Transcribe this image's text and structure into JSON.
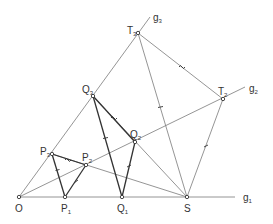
{
  "diagram": {
    "type": "geometric-construction",
    "colors": {
      "line": "#7a7a7a",
      "segment": "#333333",
      "point_fill": "#ffffff",
      "text": "#333333"
    },
    "points": {
      "O": {
        "x": 19,
        "y": 197,
        "label": "O",
        "sub": ""
      },
      "P1": {
        "x": 65,
        "y": 197,
        "label": "P",
        "sub": "1"
      },
      "Q1": {
        "x": 122,
        "y": 197,
        "label": "Q",
        "sub": "1"
      },
      "S": {
        "x": 187,
        "y": 197,
        "label": "S",
        "sub": ""
      },
      "P3": {
        "x": 52,
        "y": 154,
        "label": "P",
        "sub": "3"
      },
      "P2": {
        "x": 86,
        "y": 165,
        "label": "P",
        "sub": "2"
      },
      "Q3": {
        "x": 93,
        "y": 96,
        "label": "Q",
        "sub": "3"
      },
      "Q2": {
        "x": 135,
        "y": 142,
        "label": "Q",
        "sub": "2"
      },
      "T3": {
        "x": 138,
        "y": 33,
        "label": "T",
        "sub": "3"
      },
      "T2": {
        "x": 223,
        "y": 99,
        "label": "T",
        "sub": "2"
      }
    },
    "lines": [
      {
        "name": "g1",
        "label": "g",
        "sub": "1"
      },
      {
        "name": "g2",
        "label": "g",
        "sub": "2"
      },
      {
        "name": "g3",
        "label": "g",
        "sub": "3"
      }
    ],
    "segments_thin": [
      "O-g1end",
      "O-g2end",
      "O-g3end",
      "P3-S",
      "Q3-S",
      "T3-S",
      "T3-T2",
      "T2-S"
    ],
    "segments_thick": [
      "P3-P1",
      "P1-P2",
      "P3-P2",
      "Q3-Q1",
      "Q1-Q2",
      "Q3-Q2"
    ],
    "tick_marks": {
      "single_bar": [
        "P3-P1",
        "Q3-Q1",
        "T3-S"
      ],
      "single_slash": [
        "P1-P2",
        "Q1-Q2",
        "T2-S"
      ],
      "tilde": [
        "P3-P2",
        "Q3-Q2",
        "T3-T2"
      ]
    }
  }
}
